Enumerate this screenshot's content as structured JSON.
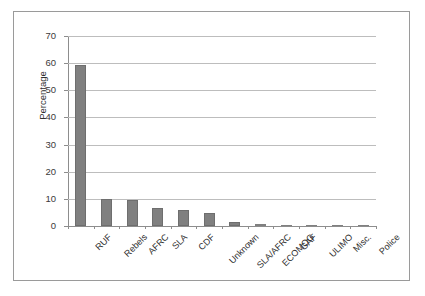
{
  "chart_data": {
    "type": "bar",
    "title": "",
    "subtitle": "",
    "xlabel": "",
    "ylabel": "Percentage",
    "ylim": [
      0,
      70
    ],
    "ytick_step": 10,
    "yticks": [
      0,
      10,
      20,
      30,
      40,
      50,
      60,
      70
    ],
    "ytick_labels": [
      "0",
      "10",
      "20",
      "30",
      "40",
      "50",
      "60",
      "70"
    ],
    "grid": true,
    "grid_axis": "y",
    "legend": false,
    "legend_position": "none",
    "categories": [
      "RUF",
      "Rebels",
      "AFRC",
      "SLA",
      "CDF",
      "Unknown",
      "SLA/AFRC",
      "ECOMOG",
      "GAF",
      "ULIMO",
      "Misc.",
      "Police"
    ],
    "values": [
      59.2,
      9.9,
      9.6,
      6.7,
      6.0,
      4.9,
      1.3,
      0.6,
      0.35,
      0.2,
      0.15,
      0.05
    ],
    "series": [
      {
        "name": "Percentage",
        "values": [
          59.2,
          9.9,
          9.6,
          6.7,
          6.0,
          4.9,
          1.3,
          0.6,
          0.35,
          0.2,
          0.15,
          0.05
        ]
      }
    ],
    "bar_color": "#808080",
    "background_color": "#ffffff",
    "gridline_color": "#bdbdbd",
    "axis_color": "#8d8d8d",
    "frame_color": "#9a9a9a",
    "xtick_label_rotation": -45
  }
}
